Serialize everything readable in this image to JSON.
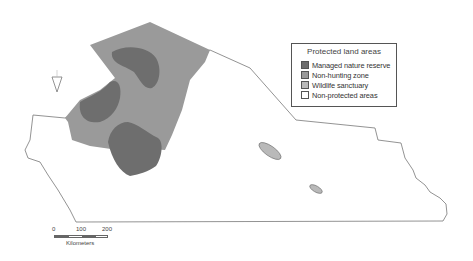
{
  "map": {
    "title": "Protected land areas",
    "colors": {
      "managed_nature_reserve": "#6e6e6e",
      "non_hunting_zone": "#9a9a9a",
      "wildlife_sanctuary": "#b9b9b9",
      "non_protected": "#ffffff",
      "boundary": "#777777"
    }
  },
  "legend": {
    "title": "Protected land areas",
    "items": [
      {
        "label": "Managed nature reserve",
        "color": "#6e6e6e"
      },
      {
        "label": "Non-hunting zone",
        "color": "#9a9a9a"
      },
      {
        "label": "Wildlife sanctuary",
        "color": "#b9b9b9"
      },
      {
        "label": "Non-protected areas",
        "color": "#ffffff"
      }
    ]
  },
  "scale_bar": {
    "ticks": [
      "0",
      "100",
      "200"
    ],
    "unit": "Kilometers"
  },
  "north_arrow": {
    "icon": "north-arrow-icon"
  }
}
